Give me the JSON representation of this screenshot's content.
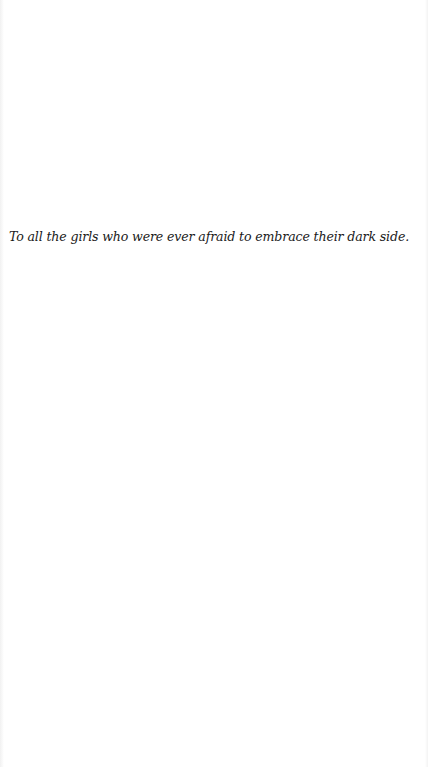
{
  "page": {
    "type": "dedication",
    "dedication_text": "To all the girls who were ever afraid to embrace their dark side.",
    "background_color": "#ffffff",
    "text_color": "#1a1a1a"
  }
}
